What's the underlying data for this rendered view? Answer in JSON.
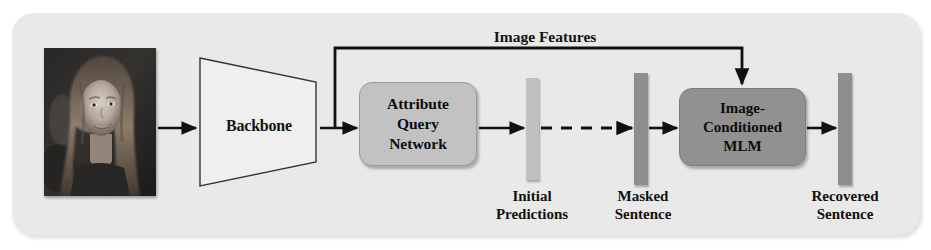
{
  "diagram": {
    "panel": {
      "background_color": "#e9e9e9",
      "corner_radius_px": 22
    },
    "input": {
      "name": "face-photo",
      "alt": "grayscale portrait photograph of a woman",
      "type": "image"
    },
    "nodes": [
      {
        "id": "backbone",
        "label": "Backbone",
        "shape": "trapezoid",
        "fill": "#efefef",
        "stroke": "#3a3a3a"
      },
      {
        "id": "attribute-query-network",
        "label": "Attribute\nQuery\nNetwork",
        "line1": "Attribute",
        "line2": "Query",
        "line3": "Network",
        "shape": "rounded-rect",
        "fill": "#c2c2c2"
      },
      {
        "id": "image-conditioned-mlm",
        "label": "Image-\nConditioned\nMLM",
        "line1": "Image-",
        "line2": "Conditioned",
        "line3": "MLM",
        "shape": "rounded-rect",
        "fill": "#919191"
      }
    ],
    "bars": [
      {
        "id": "initial-predictions",
        "caption_line1": "Initial",
        "caption_line2": "Predictions",
        "fill": "#c0c0c0"
      },
      {
        "id": "masked-sentence",
        "caption_line1": "Masked",
        "caption_line2": "Sentence",
        "fill": "#8e8e8e"
      },
      {
        "id": "recovered-sentence",
        "caption_line1": "Recovered",
        "caption_line2": "Sentence",
        "fill": "#8e8e8e"
      }
    ],
    "connectors": [
      {
        "id": "image-features-branch",
        "label": "Image Features",
        "style": "solid",
        "from": "backbone-output",
        "to": "image-conditioned-mlm-top"
      },
      {
        "id": "photo-to-backbone",
        "label": "",
        "style": "solid"
      },
      {
        "id": "backbone-to-aqn",
        "label": "",
        "style": "solid"
      },
      {
        "id": "aqn-to-initial-predictions",
        "label": "",
        "style": "solid"
      },
      {
        "id": "initial-to-masked",
        "label": "",
        "style": "dashed"
      },
      {
        "id": "masked-to-mlm",
        "label": "",
        "style": "solid"
      },
      {
        "id": "mlm-to-recovered",
        "label": "",
        "style": "solid"
      }
    ],
    "colors": {
      "panel": "#e9e9e9",
      "aqn_fill": "#c2c2c2",
      "mlm_fill": "#919191",
      "bar_light": "#c0c0c0",
      "bar_dark": "#8e8e8e",
      "stroke": "#111111"
    }
  }
}
